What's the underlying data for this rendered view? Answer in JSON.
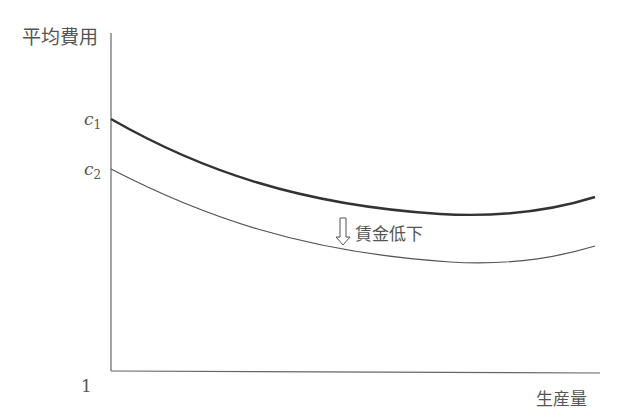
{
  "chart_data": {
    "type": "line",
    "title": "",
    "ylabel": "平均費用",
    "xlabel": "生産量",
    "origin_label": "1",
    "y_ticks": [
      {
        "label": "c",
        "sub": "1",
        "y": 119
      },
      {
        "label": "c",
        "sub": "2",
        "y": 169
      }
    ],
    "annotation": "賃金低下",
    "annotation_icon": "down-arrow-icon",
    "series": [
      {
        "name": "wage-before (c1)",
        "stroke": "#333333",
        "width": 2.4,
        "path": "M111,119 C200,170 300,205 440,214 C510,218 560,208 595,197"
      },
      {
        "name": "wage-after (c2)",
        "stroke": "#555555",
        "width": 1.2,
        "path": "M111,169 C200,215 300,252 450,262 C520,266 565,255 595,246"
      }
    ],
    "grid": false
  }
}
